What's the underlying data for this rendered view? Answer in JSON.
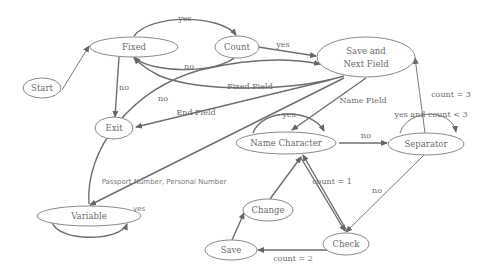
{
  "diagram": {
    "title": "",
    "nodes": {
      "start": {
        "label": "Start"
      },
      "fixed": {
        "label": "Fixed"
      },
      "count": {
        "label": "Count"
      },
      "save_next_1": {
        "label": "Save and"
      },
      "save_next_2": {
        "label": "Next Field"
      },
      "exit": {
        "label": "Exit"
      },
      "name_character": {
        "label": "Name Character"
      },
      "separator": {
        "label": "Separator"
      },
      "variable": {
        "label": "Variable"
      },
      "change": {
        "label": "Change"
      },
      "save": {
        "label": "Save"
      },
      "check": {
        "label": "Check"
      }
    },
    "edges": {
      "fixed_count_yes": {
        "label": "yes"
      },
      "count_fixed_no": {
        "label": "no"
      },
      "count_savenext_yes": {
        "label": "yes"
      },
      "fixed_exit_no": {
        "label": "no"
      },
      "variable_savenext_no": {
        "label": "no"
      },
      "savenext_fixed_fixedfield": {
        "label": "Fixed Field"
      },
      "savenext_exit_endfield": {
        "label": "End Field"
      },
      "savenext_namechar_namefield": {
        "label": "Name Field"
      },
      "namechar_self_yes": {
        "label": "yes"
      },
      "namechar_separator_no": {
        "label": "no"
      },
      "separator_self": {
        "label": "yes and count < 3"
      },
      "separator_savenext_count3": {
        "label": "count = 3"
      },
      "savenext_variable_passport": {
        "label": "Passport Number, Personal Number"
      },
      "variable_self_yes": {
        "label": "yes"
      },
      "check_namechar_count1": {
        "label": "count = 1"
      },
      "separator_check_no": {
        "label": "no"
      },
      "check_save_count2": {
        "label": "count = 2"
      },
      "save_change": {
        "label": ""
      },
      "change_namechar": {
        "label": ""
      }
    }
  }
}
